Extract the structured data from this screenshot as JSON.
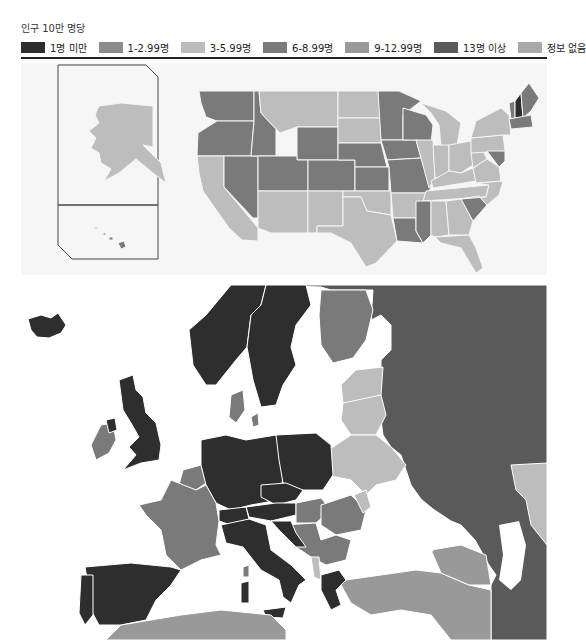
{
  "legend": {
    "title": "인구 10만 명당",
    "items": [
      {
        "label": "1명 미만",
        "color": "#2e2e2e"
      },
      {
        "label": "1-2.99명",
        "color": "#8c8c8c"
      },
      {
        "label": "3-5.99명",
        "color": "#bdbdbd"
      },
      {
        "label": "6-8.99명",
        "color": "#7a7a7a"
      },
      {
        "label": "9-12.99명",
        "color": "#999999"
      },
      {
        "label": "13명 이상",
        "color": "#5a5a5a"
      },
      {
        "label": "정보 없음",
        "color": "#a9a9a9"
      }
    ]
  },
  "maps": {
    "us": {
      "name": "United States",
      "insets": [
        "Alaska",
        "Hawaii"
      ],
      "states": [
        {
          "name": "Washington",
          "class": "6-8.99명"
        },
        {
          "name": "Oregon",
          "class": "6-8.99명"
        },
        {
          "name": "California",
          "class": "3-5.99명"
        },
        {
          "name": "Nevada",
          "class": "6-8.99명"
        },
        {
          "name": "Idaho",
          "class": "6-8.99명"
        },
        {
          "name": "Montana",
          "class": "3-5.99명"
        },
        {
          "name": "Wyoming",
          "class": "6-8.99명"
        },
        {
          "name": "Utah",
          "class": "6-8.99명"
        },
        {
          "name": "Colorado",
          "class": "6-8.99명"
        },
        {
          "name": "Arizona",
          "class": "3-5.99명"
        },
        {
          "name": "New Mexico",
          "class": "3-5.99명"
        },
        {
          "name": "North Dakota",
          "class": "3-5.99명"
        },
        {
          "name": "South Dakota",
          "class": "3-5.99명"
        },
        {
          "name": "Nebraska",
          "class": "6-8.99명"
        },
        {
          "name": "Kansas",
          "class": "6-8.99명"
        },
        {
          "name": "Oklahoma",
          "class": "3-5.99명"
        },
        {
          "name": "Texas",
          "class": "3-5.99명"
        },
        {
          "name": "Minnesota",
          "class": "6-8.99명"
        },
        {
          "name": "Iowa",
          "class": "6-8.99명"
        },
        {
          "name": "Missouri",
          "class": "6-8.99명"
        },
        {
          "name": "Arkansas",
          "class": "3-5.99명"
        },
        {
          "name": "Louisiana",
          "class": "6-8.99명"
        },
        {
          "name": "Wisconsin",
          "class": "6-8.99명"
        },
        {
          "name": "Illinois",
          "class": "3-5.99명"
        },
        {
          "name": "Michigan",
          "class": "3-5.99명"
        },
        {
          "name": "Indiana",
          "class": "3-5.99명"
        },
        {
          "name": "Ohio",
          "class": "3-5.99명"
        },
        {
          "name": "Kentucky",
          "class": "3-5.99명"
        },
        {
          "name": "Tennessee",
          "class": "3-5.99명"
        },
        {
          "name": "Mississippi",
          "class": "6-8.99명"
        },
        {
          "name": "Alabama",
          "class": "3-5.99명"
        },
        {
          "name": "Georgia",
          "class": "3-5.99명"
        },
        {
          "name": "Florida",
          "class": "3-5.99명"
        },
        {
          "name": "South Carolina",
          "class": "6-8.99명"
        },
        {
          "name": "North Carolina",
          "class": "3-5.99명"
        },
        {
          "name": "Virginia",
          "class": "3-5.99명"
        },
        {
          "name": "West Virginia",
          "class": "3-5.99명"
        },
        {
          "name": "Pennsylvania",
          "class": "3-5.99명"
        },
        {
          "name": "New York",
          "class": "3-5.99명"
        },
        {
          "name": "Maryland",
          "class": "6-8.99명"
        },
        {
          "name": "Vermont",
          "class": "6-8.99명"
        },
        {
          "name": "New Hampshire",
          "class": "1명 미만"
        },
        {
          "name": "Maine",
          "class": "6-8.99명"
        },
        {
          "name": "Massachusetts",
          "class": "6-8.99명"
        },
        {
          "name": "Alaska",
          "class": "3-5.99명"
        },
        {
          "name": "Hawaii",
          "class": "6-8.99명"
        }
      ]
    },
    "europe": {
      "name": "Europe",
      "countries": [
        {
          "name": "Iceland",
          "class": "1명 미만"
        },
        {
          "name": "Norway",
          "class": "1명 미만"
        },
        {
          "name": "Sweden",
          "class": "1명 미만"
        },
        {
          "name": "Finland",
          "class": "6-8.99명"
        },
        {
          "name": "United Kingdom",
          "class": "1명 미만"
        },
        {
          "name": "Ireland",
          "class": "6-8.99명"
        },
        {
          "name": "Denmark",
          "class": "6-8.99명"
        },
        {
          "name": "Germany",
          "class": "1명 미만"
        },
        {
          "name": "Poland",
          "class": "1명 미만"
        },
        {
          "name": "France",
          "class": "6-8.99명"
        },
        {
          "name": "Spain",
          "class": "1명 미만"
        },
        {
          "name": "Portugal",
          "class": "1명 미만"
        },
        {
          "name": "Italy",
          "class": "1명 미만"
        },
        {
          "name": "Greece",
          "class": "1명 미만"
        },
        {
          "name": "Russia",
          "class": "13명 이상"
        },
        {
          "name": "Baltic states",
          "class": "3-5.99명"
        },
        {
          "name": "Belarus",
          "class": "3-5.99명"
        },
        {
          "name": "Ukraine",
          "class": "3-5.99명"
        },
        {
          "name": "Turkey",
          "class": "9-12.99명"
        },
        {
          "name": "Kazakhstan",
          "class": "3-5.99명"
        },
        {
          "name": "North Africa",
          "class": "9-12.99명"
        }
      ]
    }
  }
}
